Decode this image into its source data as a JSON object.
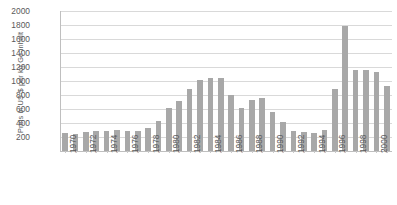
{
  "chart_data": {
    "type": "bar",
    "title": "",
    "xlabel": "",
    "ylabel": "Preis in US-$ per kg Ge-inhalt",
    "ylim": [
      0,
      2000
    ],
    "ytick_step": 200,
    "yticks": [
      2000,
      1800,
      1600,
      1400,
      1200,
      1000,
      800,
      600,
      400,
      200
    ],
    "grid": true,
    "legend": "none",
    "bar_color": "#a8a8a8",
    "gridline_color": "#d9d9d9",
    "axis_color": "#bfbfbf",
    "tick_label_color": "#595959",
    "categories": [
      "1970",
      "1971",
      "1972",
      "1973",
      "1974",
      "1975",
      "1976",
      "1977",
      "1978",
      "1979",
      "1980",
      "1981",
      "1982",
      "1983",
      "1984",
      "1985",
      "1986",
      "1987",
      "1988",
      "1989",
      "1990",
      "1991",
      "1992",
      "1993",
      "1994",
      "1995",
      "1996",
      "1997",
      "1998",
      "1999",
      "2000",
      "2001"
    ],
    "xtick_labels": [
      "1970",
      "1972",
      "1974",
      "1976",
      "1978",
      "1980",
      "1982",
      "1984",
      "1986",
      "1988",
      "1990",
      "1992",
      "1994",
      "1996",
      "1998",
      "2000"
    ],
    "values": [
      260,
      250,
      275,
      285,
      280,
      300,
      290,
      285,
      330,
      430,
      620,
      720,
      890,
      1020,
      1040,
      1040,
      800,
      620,
      730,
      760,
      560,
      420,
      290,
      270,
      260,
      300,
      880,
      1780,
      1160,
      1160,
      1130,
      930
    ]
  }
}
